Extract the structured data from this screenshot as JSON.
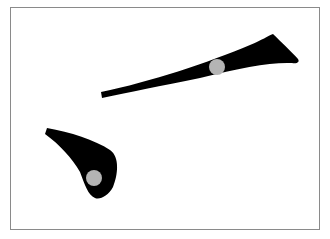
{
  "diagram": {
    "colors": {
      "stroke": "#000000",
      "marker": "#b4b4b4",
      "frame_border": "#8a8a8a",
      "background": "#ffffff"
    },
    "strokes": [
      {
        "name": "upper-stroke",
        "marker": {
          "cx": 217,
          "cy": 67,
          "r": 8
        }
      },
      {
        "name": "lower-stroke",
        "marker": {
          "cx": 94,
          "cy": 178,
          "r": 8
        }
      }
    ]
  }
}
